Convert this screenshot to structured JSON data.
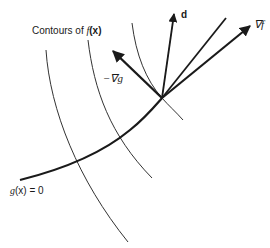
{
  "figure": {
    "labels": {
      "contours": "Contours of",
      "contours_fn": "f",
      "contours_arg": "(x)",
      "d": "d",
      "grad_f": "∇f",
      "neg_grad_g": "−∇g",
      "constraint": "g",
      "constraint_arg": "(x) = 0"
    },
    "colors": {
      "stroke": "#1a1a1a",
      "contour": "#333333",
      "background": "#ffffff"
    },
    "point": {
      "x": 162,
      "y": 98
    }
  }
}
